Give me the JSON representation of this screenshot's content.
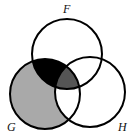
{
  "diagram": {
    "type": "venn",
    "sets": [
      {
        "name": "F",
        "cx": 67,
        "cy": 54,
        "r": 35
      },
      {
        "name": "G",
        "cx": 45,
        "cy": 94,
        "r": 35
      },
      {
        "name": "H",
        "cx": 90,
        "cy": 92,
        "r": 35
      }
    ],
    "labels": {
      "F": "F",
      "G": "G",
      "H": "H"
    },
    "shaded_regions": [
      {
        "region": "G only",
        "color": "#a9a9a9"
      },
      {
        "region": "F ∩ G − H",
        "color": "#000000"
      },
      {
        "region": "F ∩ G ∩ H",
        "color": "#555555"
      }
    ],
    "colors": {
      "stroke": "#000000",
      "background": "#ffffff"
    }
  }
}
